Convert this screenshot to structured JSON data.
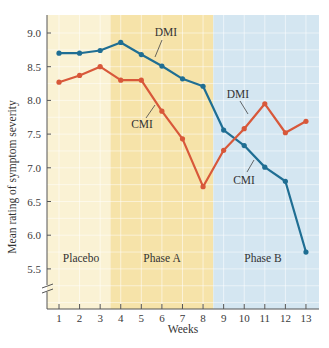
{
  "chart_data": {
    "type": "line",
    "title": "",
    "xlabel": "Weeks",
    "ylabel": "Mean rating of symptom severity",
    "x": [
      1,
      2,
      3,
      4,
      5,
      6,
      7,
      8,
      9,
      10,
      11,
      12,
      13
    ],
    "x_ticks": [
      "1",
      "2",
      "3",
      "4",
      "5",
      "6",
      "7",
      "8",
      "9",
      "10",
      "11",
      "12",
      "13"
    ],
    "y_ticks": [
      "9.0",
      "8.5",
      "8.0",
      "7.5",
      "7.0",
      "6.5",
      "6.0",
      "5.5"
    ],
    "y_tick_values": [
      9.0,
      8.5,
      8.0,
      7.5,
      7.0,
      6.5,
      6.0,
      5.5
    ],
    "ylim": [
      5.0,
      9.3
    ],
    "y_axis_break": true,
    "grid": true,
    "series": [
      {
        "name": "DMI",
        "color": "#1f6e93",
        "values": [
          8.7,
          8.7,
          8.74,
          8.86,
          8.68,
          8.51,
          8.32,
          8.21,
          7.56,
          7.33,
          7.01,
          6.8,
          5.75
        ]
      },
      {
        "name": "CMI",
        "color": "#d8583a",
        "values": [
          8.27,
          8.37,
          8.5,
          8.3,
          8.3,
          7.84,
          7.43,
          6.72,
          7.26,
          7.58,
          7.95,
          7.52,
          7.69
        ]
      }
    ],
    "phases": [
      {
        "label": "Placebo",
        "from_week": 0.5,
        "to_week": 3.5,
        "color": "#faf2d4"
      },
      {
        "label": "Phase A",
        "from_week": 3.5,
        "to_week": 8.5,
        "color": "#f6e3a9"
      },
      {
        "label": "Phase B",
        "from_week": 8.5,
        "to_week": 13.5,
        "color": "#d4e6f1"
      }
    ],
    "annotations": [
      {
        "text": "DMI",
        "x": 166,
        "y": 36,
        "line": [
          162,
          40,
          155,
          57
        ]
      },
      {
        "text": "CMI",
        "x": 142,
        "y": 128,
        "line": [
          146,
          118,
          155,
          105
        ]
      },
      {
        "text": "DMI",
        "x": 238,
        "y": 98,
        "line": [
          240,
          101,
          248,
          114
        ]
      },
      {
        "text": "CMI",
        "x": 244,
        "y": 184,
        "line": [
          247,
          172,
          254,
          160
        ]
      }
    ]
  }
}
